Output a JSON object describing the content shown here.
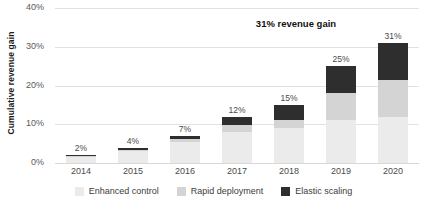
{
  "chart_data": {
    "type": "bar",
    "stacked": true,
    "title": "",
    "xlabel": "",
    "ylabel": "Cumulative revenue gain",
    "ylim": [
      0,
      40
    ],
    "ytick_labels": [
      "0%",
      "10%",
      "20%",
      "30%",
      "40%"
    ],
    "ytick_values": [
      0,
      10,
      20,
      30,
      40
    ],
    "grid": true,
    "legend_position": "bottom",
    "categories": [
      "2014",
      "2015",
      "2016",
      "2017",
      "2018",
      "2019",
      "2020"
    ],
    "series": [
      {
        "name": "Enhanced control",
        "color": "#ebebeb",
        "values": [
          1.6,
          3.0,
          5.4,
          8.0,
          9.0,
          11.0,
          12.0
        ]
      },
      {
        "name": "Rapid deployment",
        "color": "#d4d4d4",
        "values": [
          0.1,
          0.4,
          0.8,
          1.8,
          2.0,
          7.0,
          9.5
        ]
      },
      {
        "name": "Elastic scaling",
        "color": "#2e2e2e",
        "values": [
          0.3,
          0.6,
          0.8,
          2.2,
          4.0,
          7.0,
          9.5
        ]
      }
    ],
    "totals": [
      2,
      4,
      7,
      12,
      15,
      25,
      31
    ],
    "total_labels": [
      "2%",
      "4%",
      "7%",
      "12%",
      "15%",
      "25%",
      "31%"
    ],
    "annotations": [
      {
        "text": "31% revenue gain",
        "category": "2019"
      }
    ]
  }
}
